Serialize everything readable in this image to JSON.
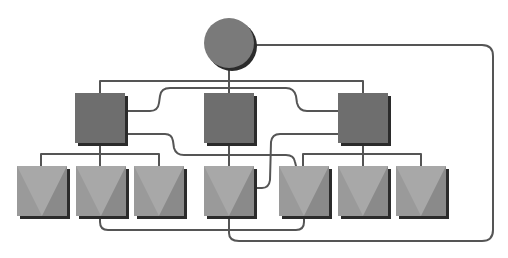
{
  "diagram": {
    "type": "hierarchy-network",
    "colors": {
      "root": "#7a7a7a",
      "mid": "#6e6e6e",
      "leaf": "#9a9a9a",
      "leaf_light": "#a8a8a8",
      "shadow": "#2b2b2b",
      "wire": "#555555",
      "background": "#ffffff"
    },
    "nodes": {
      "root": {
        "id": "root",
        "shape": "circle",
        "level": 0
      },
      "mid": [
        {
          "id": "mid-1",
          "shape": "square",
          "level": 1
        },
        {
          "id": "mid-2",
          "shape": "square",
          "level": 1
        },
        {
          "id": "mid-3",
          "shape": "square",
          "level": 1
        }
      ],
      "leaves": [
        {
          "id": "leaf-1",
          "shape": "square-v",
          "level": 2,
          "parent": "mid-1"
        },
        {
          "id": "leaf-2",
          "shape": "square-v",
          "level": 2,
          "parent": "mid-1"
        },
        {
          "id": "leaf-3",
          "shape": "square-v",
          "level": 2,
          "parent": "mid-1"
        },
        {
          "id": "leaf-4",
          "shape": "square-v",
          "level": 2,
          "parent": "mid-2"
        },
        {
          "id": "leaf-5",
          "shape": "square-v",
          "level": 2,
          "parent": "mid-3"
        },
        {
          "id": "leaf-6",
          "shape": "square-v",
          "level": 2,
          "parent": "mid-3"
        },
        {
          "id": "leaf-7",
          "shape": "square-v",
          "level": 2,
          "parent": "mid-3"
        }
      ]
    },
    "edges": [
      {
        "from": "root",
        "to": "mid-1",
        "kind": "tree"
      },
      {
        "from": "root",
        "to": "mid-2",
        "kind": "tree"
      },
      {
        "from": "root",
        "to": "mid-3",
        "kind": "tree"
      },
      {
        "from": "mid-1",
        "to": "leaf-1",
        "kind": "tree"
      },
      {
        "from": "mid-1",
        "to": "leaf-2",
        "kind": "tree"
      },
      {
        "from": "mid-1",
        "to": "leaf-3",
        "kind": "tree"
      },
      {
        "from": "mid-2",
        "to": "leaf-4",
        "kind": "tree"
      },
      {
        "from": "mid-3",
        "to": "leaf-5",
        "kind": "tree"
      },
      {
        "from": "mid-3",
        "to": "leaf-6",
        "kind": "tree"
      },
      {
        "from": "mid-3",
        "to": "leaf-7",
        "kind": "tree"
      },
      {
        "from": "mid-1",
        "to": "mid-3",
        "kind": "cross-link"
      },
      {
        "from": "mid-1",
        "to": "leaf-5",
        "kind": "cross-link"
      },
      {
        "from": "mid-3",
        "to": "leaf-4",
        "kind": "cross-link"
      },
      {
        "from": "leaf-2",
        "to": "leaf-5",
        "kind": "cross-link"
      },
      {
        "from": "root",
        "to": "leaf-4",
        "kind": "cross-link"
      }
    ]
  }
}
